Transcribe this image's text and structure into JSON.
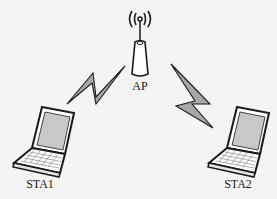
{
  "diagram": {
    "type": "wireless network topology",
    "nodes": [
      {
        "id": "ap",
        "label": "AP",
        "icon": "access-point-icon"
      },
      {
        "id": "sta1",
        "label": "STA1",
        "icon": "laptop-icon"
      },
      {
        "id": "sta2",
        "label": "STA2",
        "icon": "laptop-icon"
      }
    ],
    "links": [
      {
        "from": "sta1",
        "to": "ap",
        "icon": "lightning-bolt-icon",
        "style": "wireless"
      },
      {
        "from": "ap",
        "to": "sta2",
        "icon": "lightning-bolt-icon",
        "style": "wireless"
      }
    ],
    "colors": {
      "background": "#f4f4f4",
      "stroke": "#1a1a1a",
      "bolt_fill": "#a8a8a8",
      "screen_fill": "#c8c8c8"
    }
  }
}
